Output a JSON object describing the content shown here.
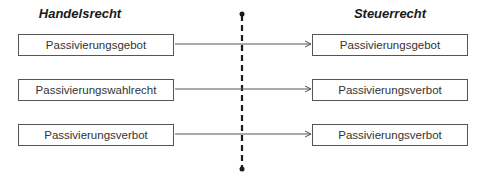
{
  "headings": {
    "left": "Handelsrecht",
    "right": "Steuerrecht"
  },
  "rows": [
    {
      "left": "Passivierungsgebot",
      "right": "Passivierungsgebot"
    },
    {
      "left": "Passivierungswahlrecht",
      "right": "Passivierungsverbot"
    },
    {
      "left": "Passivierungsverbot",
      "right": "Passivierungsverbot"
    }
  ],
  "colors": {
    "line": "#555555",
    "divider": "#1a1a1a",
    "text": "#333333"
  }
}
